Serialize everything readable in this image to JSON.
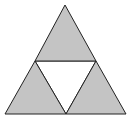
{
  "figure": {
    "colors": {
      "fill": "#c4c4c4",
      "stroke": "#222222",
      "center": "#ffffff",
      "background": "#ffffff"
    },
    "triangles": [
      {
        "name": "top",
        "points": "65,5 35,61 96,61",
        "shaded": true
      },
      {
        "name": "bottom-left",
        "points": "35,61 5,114 66,114",
        "shaded": true
      },
      {
        "name": "bottom-right",
        "points": "96,61 66,114 126,114",
        "shaded": true
      },
      {
        "name": "center",
        "points": "35,61 96,61 66,114",
        "shaded": false
      }
    ]
  }
}
